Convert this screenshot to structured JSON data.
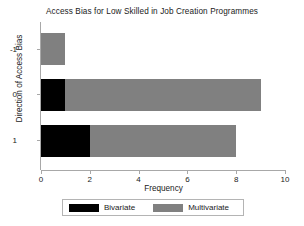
{
  "chart_data": {
    "type": "bar",
    "orientation": "horizontal",
    "stacked": true,
    "title": "Access Bias for Low Skilled in Job Creation Programmes",
    "xlabel": "Frequency",
    "ylabel": "Direction of Access Bias",
    "categories": [
      "-1",
      "0",
      "1"
    ],
    "series": [
      {
        "name": "Bivariate",
        "color": "#000000",
        "values": [
          0,
          1,
          2
        ]
      },
      {
        "name": "Multivariate",
        "color": "#808080",
        "values": [
          1,
          8,
          6
        ]
      }
    ],
    "totals": [
      1,
      9,
      8
    ],
    "xlim": [
      0,
      10
    ],
    "xticks": [
      "0",
      "2",
      "4",
      "6",
      "8",
      "10"
    ],
    "xtick_values": [
      0,
      2,
      4,
      6,
      8,
      10
    ],
    "yticks": [
      "-1",
      "0",
      "1"
    ],
    "grid": false,
    "legend_position": "bottom",
    "background_color": "#ffffff",
    "axis_color": "#a8a8a8"
  },
  "legend": {
    "entries": [
      {
        "label": "Bivariate",
        "color": "#000000"
      },
      {
        "label": "Multivariate",
        "color": "#808080"
      }
    ]
  }
}
